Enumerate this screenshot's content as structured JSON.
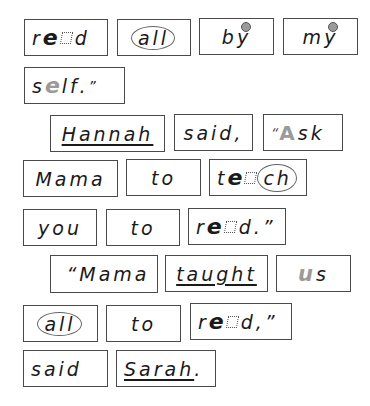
{
  "page": {
    "colors": {
      "border": "#4a4a4a",
      "text": "#1a1a1a",
      "grey_highlight": "#9a9a9a"
    }
  },
  "rows": [
    {
      "words": [
        {
          "id": "w1",
          "text": "read",
          "parts": [
            "r",
            "e",
            "a",
            "d"
          ],
          "marks": "bold e, silent a (dotted box)"
        },
        {
          "id": "w2",
          "text": "all",
          "marks": "circled"
        },
        {
          "id": "w3",
          "text": "by",
          "parts": [
            "b",
            "y"
          ],
          "marks": "grey dot over y"
        },
        {
          "id": "w4",
          "text": "my",
          "parts": [
            "m",
            "y"
          ],
          "marks": "grey dot over y"
        }
      ]
    },
    {
      "words": [
        {
          "id": "w5",
          "text": "self.\"",
          "parts": [
            "s",
            "e",
            "lf.",
            "”"
          ],
          "marks": "grey e"
        }
      ]
    },
    {
      "words": [
        {
          "id": "w6",
          "text": "Hannah",
          "marks": "underlined"
        },
        {
          "id": "w7",
          "text": "said,"
        },
        {
          "id": "w8",
          "text": "“Ask",
          "parts": [
            "“",
            "A",
            "sk"
          ],
          "marks": "grey A"
        }
      ]
    },
    {
      "words": [
        {
          "id": "w9",
          "text": "Mama"
        },
        {
          "id": "w10",
          "text": "to"
        },
        {
          "id": "w11",
          "text": "teach",
          "parts": [
            "t",
            "e",
            "a",
            "ch"
          ],
          "marks": "bold e, silent a, circled ch"
        }
      ]
    },
    {
      "words": [
        {
          "id": "w12",
          "text": "you"
        },
        {
          "id": "w13",
          "text": "to"
        },
        {
          "id": "w14",
          "text": "read.”",
          "parts": [
            "r",
            "e",
            "a",
            "d.”"
          ],
          "marks": "bold e, silent a"
        }
      ]
    },
    {
      "words": [
        {
          "id": "w15",
          "text": "“Mama"
        },
        {
          "id": "w16",
          "text": "taught",
          "marks": "underlined"
        },
        {
          "id": "w17",
          "text": "us",
          "parts": [
            "u",
            "s"
          ],
          "marks": "grey u"
        }
      ]
    },
    {
      "words": [
        {
          "id": "w18",
          "text": "all",
          "marks": "circled"
        },
        {
          "id": "w19",
          "text": "to"
        },
        {
          "id": "w20",
          "text": "read,”",
          "parts": [
            "r",
            "e",
            "a",
            "d,”"
          ],
          "marks": "bold e, silent a"
        }
      ]
    },
    {
      "words": [
        {
          "id": "w21",
          "text": "said"
        },
        {
          "id": "w22",
          "text": "Sarah.",
          "parts": [
            "Sarah",
            "."
          ],
          "marks": "underlined Sarah"
        }
      ]
    }
  ]
}
